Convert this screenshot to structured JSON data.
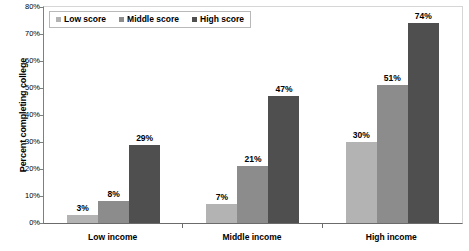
{
  "chart_data": {
    "type": "bar",
    "title": "",
    "xlabel": "",
    "ylabel": "Percent completing college",
    "ylim": [
      0,
      80
    ],
    "ytick_labels": [
      "80%",
      "70%",
      "60%",
      "50%",
      "40%",
      "30%",
      "20%",
      "10%",
      "0%"
    ],
    "ytick_values": [
      80,
      70,
      60,
      50,
      40,
      30,
      20,
      10,
      0
    ],
    "grid": false,
    "legend_position": "top-left",
    "categories": [
      "Low income",
      "Middle income",
      "High income"
    ],
    "series": [
      {
        "name": "Low score",
        "color": "#b3b3b3",
        "values": [
          3,
          7,
          30
        ],
        "labels": [
          "3%",
          "7%",
          "30%"
        ]
      },
      {
        "name": "Middle score",
        "color": "#8c8c8c",
        "values": [
          8,
          21,
          51
        ],
        "labels": [
          "8%",
          "21%",
          "51%"
        ]
      },
      {
        "name": "High score",
        "color": "#4f4f4f",
        "values": [
          29,
          47,
          74
        ],
        "labels": [
          "29%",
          "47%",
          "74%"
        ]
      }
    ]
  },
  "axis": {
    "y_title": "Percent completing college"
  },
  "legend": {
    "items": [
      {
        "label": "Low score",
        "color": "#b3b3b3"
      },
      {
        "label": "Middle score",
        "color": "#8c8c8c"
      },
      {
        "label": "High score",
        "color": "#4f4f4f"
      }
    ]
  }
}
